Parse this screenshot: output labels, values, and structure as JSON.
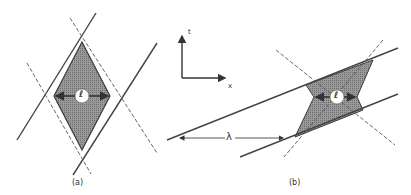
{
  "figure": {
    "panel_a": {
      "caption": "(a)",
      "center_label": "ℓ",
      "shape": "diamond",
      "fill_color": "#8c8c8c",
      "line_color": "#3a3a3a"
    },
    "panel_b": {
      "caption": "(b)",
      "center_label": "ℓ",
      "shape": "skewed bowtie parallelogram",
      "wavelength_label": "λ",
      "fill_color": "#8c8c8c"
    },
    "axes": {
      "vertical_label": "t",
      "horizontal_label": "x"
    }
  }
}
